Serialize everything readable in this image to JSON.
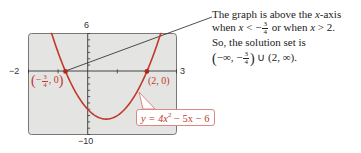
{
  "chart_data": {
    "type": "line",
    "title": "",
    "equation_label": "y = 4x² − 5x − 6",
    "function": {
      "a": 4,
      "b": -5,
      "c": -6
    },
    "xlim": [
      -2,
      3
    ],
    "ylim": [
      -10,
      6
    ],
    "xlabel": "",
    "ylabel": "",
    "grid": false,
    "window_labels": {
      "xmin": "−2",
      "xmax": "3",
      "ymin": "−10",
      "ymax": "6"
    },
    "series": [
      {
        "name": "y = 4x^2 - 5x - 6",
        "color": "#c0392b",
        "x": [
          -1.0,
          -0.75,
          -0.5,
          0,
          0.5,
          0.625,
          1.0,
          1.5,
          2.0,
          2.25
        ],
        "y": [
          3.0,
          0.0,
          -2.5,
          -6.0,
          -7.5,
          -7.5625,
          -7.0,
          -4.5,
          0.0,
          3.0
        ]
      }
    ],
    "points": [
      {
        "x": -0.75,
        "y": 0,
        "label": "(−3/4, 0)"
      },
      {
        "x": 2,
        "y": 0,
        "label": "(2, 0)"
      }
    ],
    "annotations": [
      "The graph is above the x-axis when x < −3/4 or when x > 2.",
      "So, the solution set is (−∞, −3/4) ∪ (2, ∞)."
    ]
  },
  "caption": {
    "line1_pre": "The graph is above the ",
    "line1_var": "x",
    "line1_post": "-axis",
    "line2_a": "when ",
    "line2_var1": "x",
    "line2_lt": " < −",
    "frac_num": "3",
    "frac_den": "4",
    "line2_or": " or when ",
    "line2_var2": "x",
    "line2_gt": " > 2.",
    "line3": "So, the solution set is",
    "set_open": "(",
    "set_a": "−∞, −",
    "set_close": ")",
    "set_union": " ∪ (2, ∞)."
  },
  "points": {
    "left": {
      "open": "(",
      "minus": "−",
      "num": "3",
      "den": "4",
      "rest": ", 0",
      "close": ")"
    },
    "right": "(2, 0)"
  },
  "equation": {
    "pre": "y = 4",
    "var": "x",
    "exp": "2",
    "post": " − 5x − 6"
  },
  "window": {
    "xmin": "−2",
    "xmax": "3",
    "ymin": "−10",
    "ymax": "6"
  }
}
